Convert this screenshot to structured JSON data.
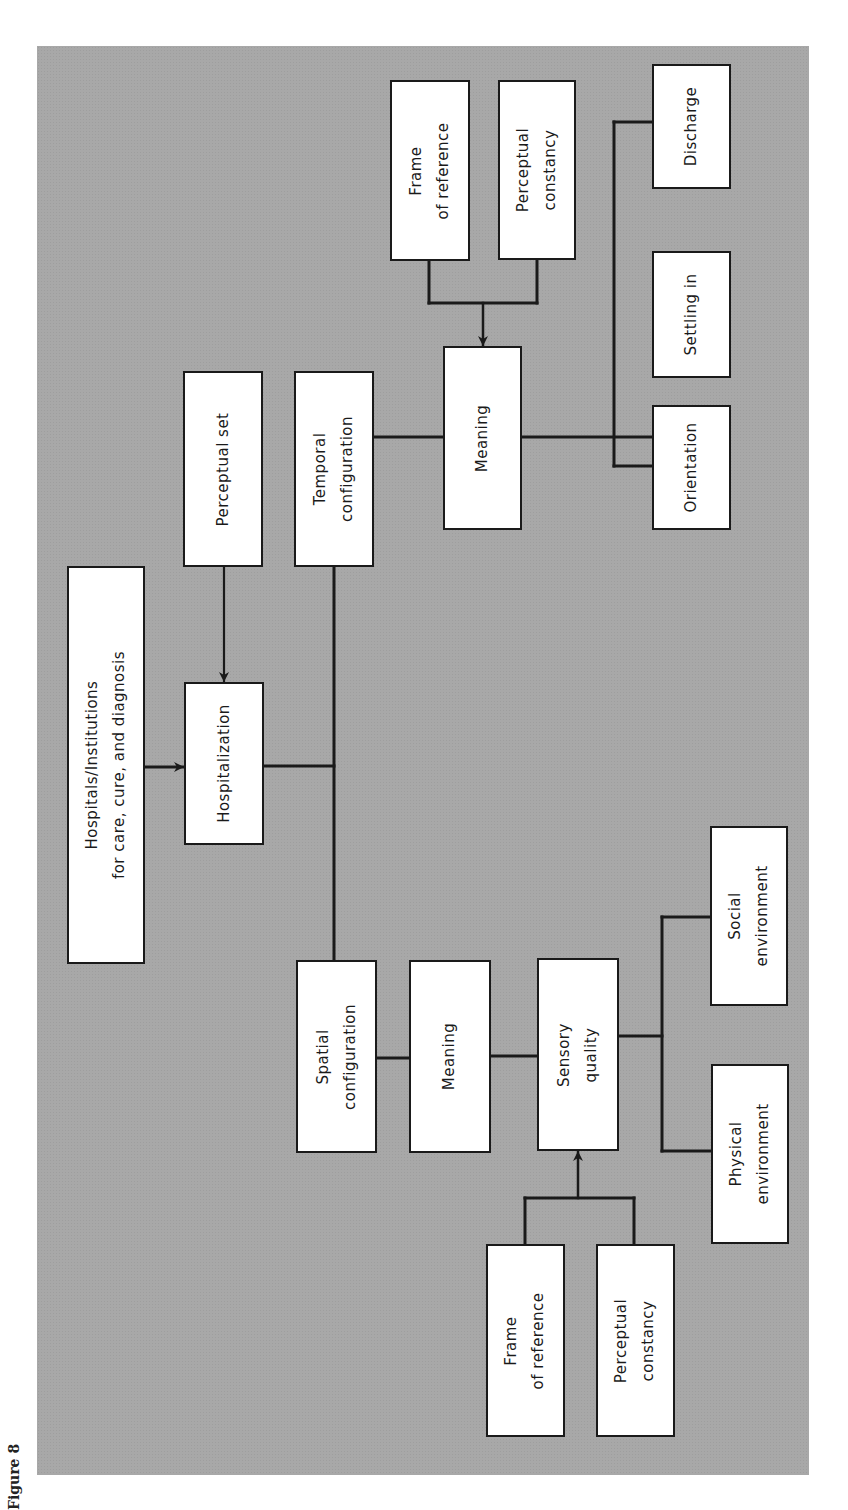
{
  "figure": {
    "caption": "Figure 8",
    "background_color": "#a8a8a8",
    "box_fill": "#ffffff",
    "line_color": "#1a1a1a",
    "orientation": "rotated 90deg counter-clockwise (text reads bottom-to-top)"
  },
  "nodes": {
    "hospitals": "Hospitals/Institutions\nfor care, cure, and diagnosis",
    "hospitalization": "Hospitalization",
    "perceptual_set": "Perceptual set",
    "temporal_configuration": "Temporal\nconfiguration",
    "meaning_temporal": "Meaning",
    "frame_of_reference_top": "Frame\nof reference",
    "perceptual_constancy_top": "Perceptual\nconstancy",
    "discharge": "Discharge",
    "settling_in": "Settling in",
    "orientation": "Orientation",
    "spatial_configuration": "Spatial\nconfiguration",
    "meaning_spatial": "Meaning",
    "sensory_quality": "Sensory\nquality",
    "social_environment": "Social\nenvironment",
    "physical_environment": "Physical\nenvironment",
    "frame_of_reference_bottom": "Frame\nof reference",
    "perceptual_constancy_bottom": "Perceptual\nconstancy"
  },
  "edges": [
    {
      "from": "Hospitals/Institutions for care, cure, and diagnosis",
      "to": "Hospitalization",
      "type": "arrow"
    },
    {
      "from": "Perceptual set",
      "to": "Hospitalization",
      "type": "arrow"
    },
    {
      "from": "Hospitalization",
      "to": "Temporal configuration",
      "type": "line"
    },
    {
      "from": "Hospitalization",
      "to": "Spatial configuration",
      "type": "line"
    },
    {
      "from": "Temporal configuration",
      "to": "Meaning",
      "type": "line"
    },
    {
      "from": "Frame of reference",
      "to": "Meaning",
      "type": "arrow (merged)"
    },
    {
      "from": "Perceptual constancy",
      "to": "Meaning",
      "type": "arrow (merged)"
    },
    {
      "from": "Meaning",
      "to": "Discharge",
      "type": "line"
    },
    {
      "from": "Meaning",
      "to": "Settling in",
      "type": "line"
    },
    {
      "from": "Meaning",
      "to": "Orientation",
      "type": "line"
    },
    {
      "from": "Spatial configuration",
      "to": "Meaning",
      "type": "line"
    },
    {
      "from": "Meaning",
      "to": "Sensory quality",
      "type": "line"
    },
    {
      "from": "Frame of reference",
      "to": "Sensory quality",
      "type": "arrow (merged)"
    },
    {
      "from": "Perceptual constancy",
      "to": "Sensory quality",
      "type": "arrow (merged)"
    },
    {
      "from": "Sensory quality",
      "to": "Social environment",
      "type": "line"
    },
    {
      "from": "Sensory quality",
      "to": "Physical environment",
      "type": "line"
    }
  ]
}
